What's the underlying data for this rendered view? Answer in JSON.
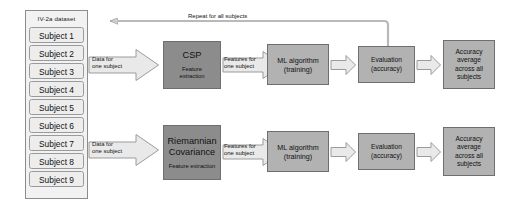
{
  "diagram": {
    "dataset": {
      "header": "IV-2a dataset",
      "subjects": [
        "Subject 1",
        "Subject 2",
        "Subject 3",
        "Subject 4",
        "Subject 5",
        "Subject 6",
        "Subject 7",
        "Subject 8",
        "Subject 9"
      ]
    },
    "loop": {
      "label": "Repeat for all subjects"
    },
    "branches": {
      "top": {
        "input_arrow_label_line1": "Data for",
        "input_arrow_label_line2": "one subject",
        "feature_block_title": "CSP",
        "feature_block_subtitle_line1": "Feature",
        "feature_block_subtitle_line2": "extraction",
        "features_arrow_label_line1": "Features for",
        "features_arrow_label_line2": "one subject",
        "ml_block_line1": "ML algorithm",
        "ml_block_line2": "(training)",
        "eval_block_line1": "Evaluation",
        "eval_block_line2": "(accuracy)",
        "accuracy_block_line1": "Accuracy",
        "accuracy_block_line2": "average",
        "accuracy_block_line3": "across all",
        "accuracy_block_line4": "subjects"
      },
      "bottom": {
        "input_arrow_label_line1": "Data for",
        "input_arrow_label_line2": "one subject",
        "feature_block_title_line1": "Riemannian",
        "feature_block_title_line2": "Covariance",
        "feature_block_subtitle": "Feature extraction",
        "features_arrow_label_line1": "Features for",
        "features_arrow_label_line2": "one subject",
        "ml_block_line1": "ML algorithm",
        "ml_block_line2": "(training)",
        "eval_block_line1": "Evaluation",
        "eval_block_line2": "(accuracy)",
        "accuracy_block_line1": "Accuracy",
        "accuracy_block_line2": "average",
        "accuracy_block_line3": "across all",
        "accuracy_block_line4": "subjects"
      }
    },
    "colors": {
      "dark_block": "#8c8c8c",
      "light_block": "#b2b2b2",
      "arrow_fill": "#e8e8e8",
      "outline": "#8c8c8c",
      "subject_fill": "#ededed"
    }
  }
}
